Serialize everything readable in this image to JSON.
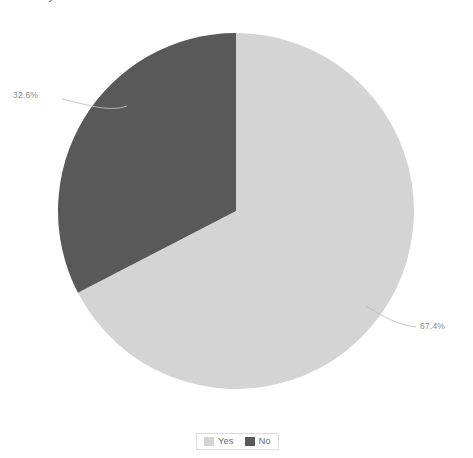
{
  "chart_data": {
    "type": "pie",
    "title": "",
    "categories": [
      "Yes",
      "No"
    ],
    "values": [
      67.4,
      32.6
    ],
    "value_labels": [
      "67.4%",
      "32.6%"
    ],
    "colors": [
      "#d4d4d4",
      "#595959"
    ],
    "legend_position": "bottom",
    "grid": false,
    "start_angle_deg": 90,
    "direction": "clockwise",
    "labels_outside": true,
    "leader_lines": true,
    "background": "#ffffff"
  },
  "title": {
    "text_fragment": "Does anyone have ideas"
  },
  "labels": {
    "yes_pct": "67.4%",
    "no_pct": "32.6%"
  },
  "legend": {
    "items": [
      {
        "label": "Yes",
        "color": "#d4d4d4"
      },
      {
        "label": "No",
        "color": "#595959"
      }
    ]
  }
}
